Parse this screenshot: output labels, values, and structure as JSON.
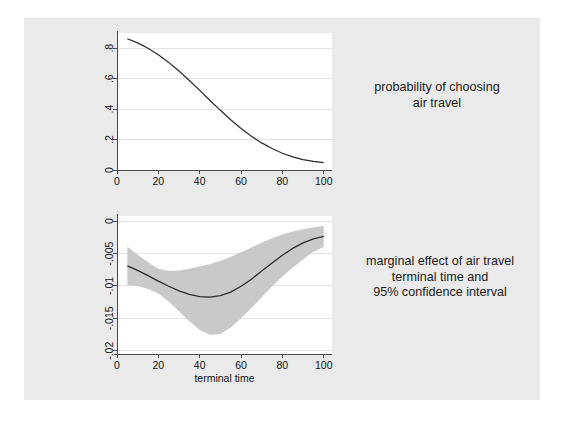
{
  "figure": {
    "background_color": "#eaeaea",
    "page_background_color": "#ffffff"
  },
  "captions": {
    "top": "probability of choosing\nair travel",
    "bottom": "marginal effect of air travel\nterminal time and\n95% confidence interval"
  },
  "chart_data": [
    {
      "id": "probability-chart",
      "type": "line",
      "title": "",
      "xlabel": "",
      "ylabel": "",
      "xlim": [
        0,
        104
      ],
      "ylim": [
        0,
        0.9
      ],
      "grid": true,
      "grid_axis": "y",
      "legend": "none",
      "xticks": [
        0,
        20,
        40,
        60,
        80,
        100
      ],
      "xticklabels": [
        "0",
        "20",
        "40",
        "60",
        "80",
        "100"
      ],
      "yticks": [
        0,
        0.2,
        0.4,
        0.6,
        0.8
      ],
      "yticklabels": [
        "0",
        ".2",
        ".4",
        ".6",
        ".8"
      ],
      "series": [
        {
          "name": "probability of choosing air travel",
          "color": "#2b2b2b",
          "x": [
            5,
            10,
            15,
            20,
            25,
            30,
            35,
            40,
            45,
            50,
            55,
            60,
            65,
            70,
            75,
            80,
            85,
            90,
            95,
            100
          ],
          "y": [
            0.862,
            0.835,
            0.8,
            0.757,
            0.707,
            0.65,
            0.588,
            0.523,
            0.457,
            0.392,
            0.33,
            0.273,
            0.222,
            0.178,
            0.141,
            0.11,
            0.086,
            0.068,
            0.056,
            0.049
          ]
        }
      ]
    },
    {
      "id": "marginal-effect-chart",
      "type": "line",
      "title": "",
      "xlabel": "terminal time",
      "ylabel": "",
      "xlim": [
        0,
        104
      ],
      "ylim": [
        -0.0205,
        0.0008
      ],
      "grid": true,
      "grid_axis": "y",
      "legend": "none",
      "xticks": [
        0,
        20,
        40,
        60,
        80,
        100
      ],
      "xticklabels": [
        "0",
        "20",
        "40",
        "60",
        "80",
        "100"
      ],
      "yticks": [
        0,
        -0.005,
        -0.01,
        -0.015,
        -0.02
      ],
      "yticklabels": [
        "0",
        "-.005",
        "-.01",
        "-.015",
        "-.02"
      ],
      "series": [
        {
          "name": "marginal effect of air travel terminal time",
          "color": "#2b2b2b",
          "x": [
            5,
            10,
            15,
            20,
            25,
            30,
            35,
            40,
            45,
            50,
            55,
            60,
            65,
            70,
            75,
            80,
            85,
            90,
            95,
            100
          ],
          "y": [
            -0.0069,
            -0.0076,
            -0.0084,
            -0.00925,
            -0.01005,
            -0.01075,
            -0.0113,
            -0.01165,
            -0.01172,
            -0.0115,
            -0.01095,
            -0.01005,
            -0.00895,
            -0.0077,
            -0.00645,
            -0.00525,
            -0.0042,
            -0.00335,
            -0.00272,
            -0.00235
          ]
        }
      ],
      "confidence_interval": {
        "name": "95% confidence interval",
        "color": "#c9c9c9",
        "level": "95%",
        "x": [
          5,
          10,
          15,
          20,
          25,
          30,
          35,
          40,
          45,
          50,
          55,
          60,
          65,
          70,
          75,
          80,
          85,
          90,
          95,
          100
        ],
        "upper": [
          -0.00395,
          -0.0052,
          -0.00635,
          -0.00735,
          -0.0077,
          -0.00762,
          -0.00735,
          -0.007,
          -0.0066,
          -0.0061,
          -0.0055,
          -0.0048,
          -0.00405,
          -0.0033,
          -0.00262,
          -0.00205,
          -0.0016,
          -0.00125,
          -0.00098,
          -0.0007
        ],
        "lower": [
          -0.00985,
          -0.01,
          -0.01045,
          -0.01115,
          -0.0124,
          -0.0139,
          -0.01545,
          -0.0168,
          -0.01755,
          -0.0174,
          -0.0164,
          -0.015,
          -0.0134,
          -0.01175,
          -0.0101,
          -0.00855,
          -0.00715,
          -0.0059,
          -0.0047,
          -0.004
        ]
      }
    }
  ]
}
